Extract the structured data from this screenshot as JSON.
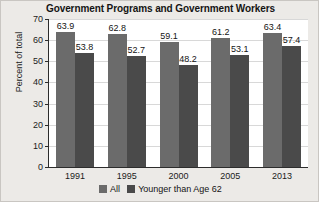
{
  "chart_data": {
    "type": "bar",
    "title": "Government Programs and Government Workers",
    "xlabel": "",
    "ylabel": "Percent of total",
    "categories": [
      "1991",
      "1995",
      "2000",
      "2005",
      "2013"
    ],
    "series": [
      {
        "name": "All",
        "color": "#6b6b6b",
        "values": [
          63.9,
          62.8,
          59.1,
          61.2,
          63.4
        ],
        "labels": [
          "63.9",
          "62.8",
          "59.1",
          "61.2",
          "63.4"
        ]
      },
      {
        "name": "Younger than Age 62",
        "color": "#4a4a4a",
        "values": [
          53.8,
          52.7,
          48.2,
          53.1,
          57.4
        ],
        "labels": [
          "53.8",
          "52.7",
          "48.2",
          "53.1",
          "57.4"
        ]
      }
    ],
    "ylim": [
      0,
      70
    ],
    "yticks": [
      0,
      10,
      20,
      30,
      40,
      50,
      60,
      70
    ],
    "ytick_labels": [
      "0",
      "10",
      "20",
      "30",
      "40",
      "50",
      "60",
      "70"
    ],
    "grid": true,
    "legend_position": "bottom"
  }
}
